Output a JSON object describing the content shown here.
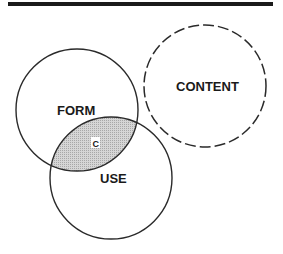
{
  "diagram": {
    "type": "venn",
    "colors": {
      "stroke": "#2a2a2a",
      "rule": "#1a1a1a",
      "intersection_fill": "#c8c8c8",
      "badge_bg": "#ffffff",
      "background": "#ffffff"
    },
    "circles": [
      {
        "id": "form",
        "label": "FORM",
        "style": "solid",
        "cx": 77,
        "cy": 110,
        "r": 61
      },
      {
        "id": "use",
        "label": "USE",
        "style": "solid",
        "cx": 111,
        "cy": 178,
        "r": 61
      },
      {
        "id": "content",
        "label": "CONTENT",
        "style": "dashed",
        "cx": 205,
        "cy": 86,
        "r": 61
      }
    ],
    "intersection": {
      "between": [
        "FORM",
        "USE"
      ],
      "label": "C",
      "fill": "hatched-gray"
    }
  }
}
